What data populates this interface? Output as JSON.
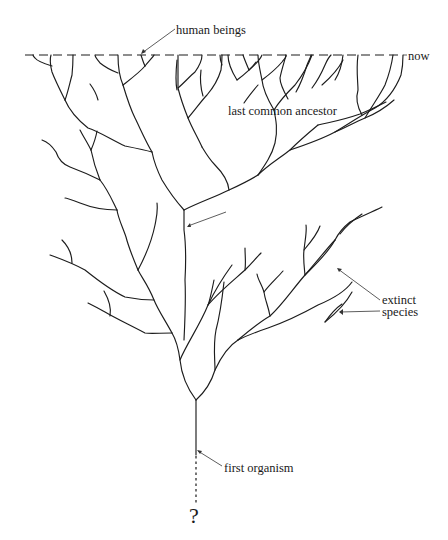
{
  "diagram": {
    "type": "evolutionary tree of life",
    "labels": {
      "human_beings": "human beings",
      "now": "now",
      "last_common_ancestor": "last common ancestor",
      "extinct_line1": "extinct",
      "extinct_line2": "species",
      "first_organism": "first organism",
      "unknown_origin": "?"
    },
    "colors": {
      "line": "#1c1c1c",
      "background": "#ffffff"
    }
  }
}
